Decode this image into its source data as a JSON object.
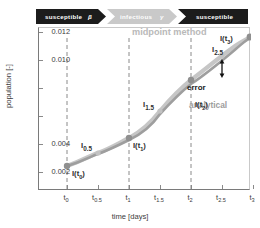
{
  "banner": {
    "segments": [
      {
        "label": "susceptible",
        "rate": "β",
        "style": "dark"
      },
      {
        "label": "infectious",
        "rate": "γ",
        "style": "light"
      },
      {
        "label": "susceptible",
        "rate": "",
        "style": "dark"
      }
    ]
  },
  "axes": {
    "xlabel": "time [days]",
    "ylabel": "population [-]",
    "ytick_labels": [
      "0.012",
      "0.010",
      "",
      "",
      "0.004",
      "0.002"
    ],
    "xtick_labels": [
      "t0",
      "t0.5",
      "t1",
      "t1.5",
      "t2",
      "t2.5",
      "t3"
    ]
  },
  "annotations": {
    "midpoint_method": "midpoint method",
    "analytical": "analytical",
    "error": "error",
    "points": [
      {
        "label": "I(t0)"
      },
      {
        "label": "I0.5"
      },
      {
        "label": "I(t1)"
      },
      {
        "label": "I1.5"
      },
      {
        "label": "I(t2)"
      },
      {
        "label": "I2.5"
      },
      {
        "label": "I(t3)"
      }
    ]
  },
  "colors": {
    "midpoint_curve": "#c4c4c4",
    "analytical_curve": "#a0a0a0",
    "marker": "#8f8f8f",
    "banner_dark": "#1c1c1c",
    "banner_light": "#c9c9c9",
    "axis": "#7a7a7a"
  },
  "chart_data": {
    "type": "line",
    "title": "",
    "xlabel": "time [days]",
    "ylabel": "population [-]",
    "xlim": [
      -0.35,
      3.35
    ],
    "ylim": [
      0.0012,
      0.0128
    ],
    "yticks": [
      0.012,
      0.01,
      0.008,
      0.006,
      0.004,
      0.002
    ],
    "ytick_labels": [
      "0.012",
      "0.010",
      "",
      "",
      "0.004",
      "0.002"
    ],
    "xticks": [
      0,
      0.5,
      1,
      1.5,
      2,
      2.5,
      3
    ],
    "xtick_labels": [
      "t0",
      "t0.5",
      "t1",
      "t1.5",
      "t2",
      "t2.5",
      "t3"
    ],
    "grid": false,
    "legend": "annotated-inline",
    "vertical_dashed_lines_at": [
      0,
      1,
      2,
      3
    ],
    "series": [
      {
        "name": "midpoint method",
        "color": "#c4c4c4",
        "x": [
          0,
          0.5,
          1,
          1.5,
          2,
          2.5,
          3
        ],
        "y": [
          0.0033,
          0.0042,
          0.00505,
          0.0064,
          0.0076,
          0.0096,
          0.01155
        ],
        "markers_at_x": [
          0,
          0.5,
          1,
          1.5,
          2,
          2.5,
          3
        ]
      },
      {
        "name": "analytical",
        "color": "#a0a0a0",
        "x": [
          0,
          0.5,
          1,
          1.5,
          2,
          2.5,
          3
        ],
        "y": [
          0.0033,
          0.00415,
          0.005,
          0.0063,
          0.00745,
          0.00905,
          0.01155
        ]
      }
    ],
    "annotations": [
      {
        "text": "midpoint method",
        "x": 1.95,
        "y": 0.0125,
        "color": "#b9b9b9"
      },
      {
        "text": "analytical",
        "x": 2.38,
        "y": 0.0084,
        "color": "#9d9d9d"
      },
      {
        "text": "error",
        "x": 2.33,
        "y": 0.00905,
        "color": "#1a1a1a"
      },
      {
        "text": "I(t0)",
        "x": 0.05,
        "y": 0.00285
      },
      {
        "text": "I0.5",
        "x": 0.33,
        "y": 0.0048
      },
      {
        "text": "I(t1)",
        "x": 1.03,
        "y": 0.0044
      },
      {
        "text": "I1.5",
        "x": 1.28,
        "y": 0.007
      },
      {
        "text": "I(t2)",
        "x": 2.03,
        "y": 0.007
      },
      {
        "text": "I2.5",
        "x": 2.32,
        "y": 0.0102
      },
      {
        "text": "I(t3)",
        "x": 3.05,
        "y": 0.0116
      }
    ],
    "error_bar": {
      "x": 2.5,
      "y_top": 0.0096,
      "y_bottom": 0.00905,
      "double_headed": true
    }
  }
}
